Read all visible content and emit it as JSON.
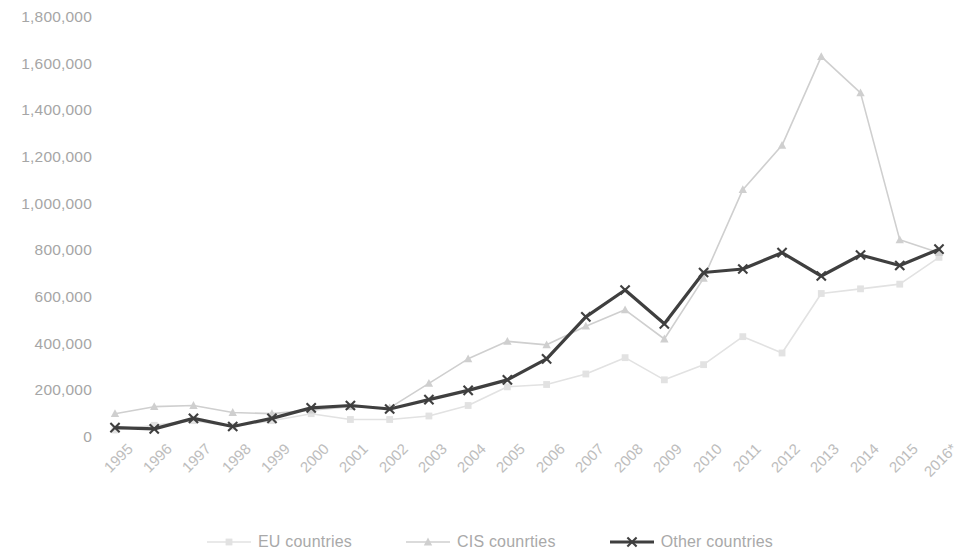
{
  "chart_data": {
    "type": "line",
    "title": "",
    "xlabel": "",
    "ylabel": "",
    "ylim": [
      0,
      1800000
    ],
    "ytick_step": 200000,
    "grid": false,
    "legend_position": "bottom",
    "x": [
      "1995",
      "1996",
      "1997",
      "1998",
      "1999",
      "2000",
      "2001",
      "2002",
      "2003",
      "2004",
      "2005",
      "2006",
      "2007",
      "2008",
      "2009",
      "2010",
      "2011",
      "2012",
      "2013",
      "2014",
      "2015",
      "2016*"
    ],
    "yticks": [
      "0",
      "200,000",
      "400,000",
      "600,000",
      "800,000",
      "1,000,000",
      "1,200,000",
      "1,400,000",
      "1,600,000",
      "1,800,000"
    ],
    "series": [
      {
        "name": "EU countries",
        "color": "#e2e2e2",
        "marker": "square",
        "values": [
          30000,
          50000,
          70000,
          45000,
          70000,
          100000,
          75000,
          75000,
          90000,
          135000,
          215000,
          225000,
          270000,
          340000,
          245000,
          310000,
          430000,
          360000,
          615000,
          635000,
          655000,
          770000
        ]
      },
      {
        "name": "CIS counrties",
        "color": "#cfcfcf",
        "marker": "triangle",
        "values": [
          100000,
          130000,
          135000,
          105000,
          100000,
          115000,
          130000,
          125000,
          230000,
          335000,
          410000,
          395000,
          475000,
          545000,
          420000,
          680000,
          1060000,
          1250000,
          1630000,
          1475000,
          845000,
          790000
        ]
      },
      {
        "name": "Other countries",
        "color": "#3f3f3f",
        "marker": "cross",
        "values": [
          40000,
          35000,
          80000,
          45000,
          80000,
          125000,
          135000,
          120000,
          160000,
          200000,
          245000,
          335000,
          515000,
          630000,
          485000,
          705000,
          720000,
          790000,
          690000,
          780000,
          735000,
          805000
        ]
      }
    ]
  },
  "legend": {
    "items": [
      {
        "label": "EU countries",
        "key": "eu-countries-key"
      },
      {
        "label": "CIS counrties",
        "key": "cis-countries-key"
      },
      {
        "label": "Other countries",
        "key": "other-countries-key"
      }
    ]
  }
}
